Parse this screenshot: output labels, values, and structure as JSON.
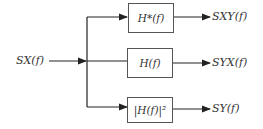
{
  "diagram": {
    "input": {
      "label": "S_X(f)"
    },
    "blocks": [
      {
        "label": "H*(f)",
        "output": "S_XY(f)"
      },
      {
        "label": "H(f)",
        "output": "S_YX(f)"
      },
      {
        "label": "|H(f)|²",
        "output": "S_Y(f)"
      }
    ]
  },
  "display": {
    "input_label": "SX(f)",
    "block1": "H*(f)",
    "block2": "H(f)",
    "block3": "|H(f)|²",
    "out1": "SXY(f)",
    "out2": "SYX(f)",
    "out3": "SY(f)"
  }
}
